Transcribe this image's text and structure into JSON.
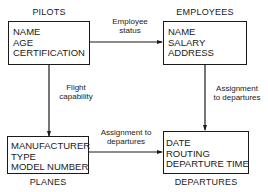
{
  "entities": [
    {
      "id": "pilots",
      "name": "PILOTS",
      "fields": [
        "NAME",
        "AGE",
        "CERTIFICATION"
      ]
    },
    {
      "id": "employees",
      "name": "EMPLOYEES",
      "fields": [
        "NAME",
        "SALARY",
        "ADDRESS"
      ]
    },
    {
      "id": "planes",
      "name": "PLANES",
      "fields": [
        "MANUFACTURER",
        "TYPE",
        "MODEL NUMBER"
      ]
    },
    {
      "id": "departures",
      "name": "DEPARTURES",
      "fields": [
        "DATE",
        "ROUTING",
        "DEPARTURE TIME"
      ]
    }
  ],
  "relationships": [
    {
      "from": "pilots",
      "to": "employees",
      "label_lines": [
        "Employee",
        "status"
      ]
    },
    {
      "from": "pilots",
      "to": "planes",
      "label_lines": [
        "Flight",
        "capability"
      ]
    },
    {
      "from": "employees",
      "to": "departures",
      "label_lines": [
        "Assignment",
        "to departures"
      ]
    },
    {
      "from": "planes",
      "to": "departures",
      "label_lines": [
        "Assignment to",
        "departures"
      ]
    }
  ]
}
